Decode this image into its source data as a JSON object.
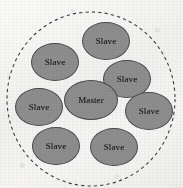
{
  "figure": {
    "type": "cluster-diagram",
    "background_color": "#f2f2f0",
    "boundary": {
      "shape": "circle",
      "style": "dashed",
      "stroke_color": "#3c3c3c",
      "center_x": 91,
      "center_y": 99,
      "radius": 84
    },
    "node_style": {
      "shape": "ellipse",
      "fill_color": "#8d8d8d",
      "stroke_color": "#4a4a4a",
      "text_color": "#1c1c1c"
    },
    "nodes": [
      {
        "id": "node-master",
        "label": "Master",
        "role": "master",
        "cx": 91,
        "cy": 100,
        "rx": 27,
        "ry": 20
      },
      {
        "id": "node-slave-1",
        "label": "Slave",
        "role": "slave",
        "cx": 106,
        "cy": 41,
        "rx": 24,
        "ry": 19
      },
      {
        "id": "node-slave-2",
        "label": "Slave",
        "role": "slave",
        "cx": 55,
        "cy": 62,
        "rx": 24,
        "ry": 19
      },
      {
        "id": "node-slave-3",
        "label": "Slave",
        "role": "slave",
        "cx": 127,
        "cy": 79,
        "rx": 24,
        "ry": 19
      },
      {
        "id": "node-slave-4",
        "label": "Slave",
        "role": "slave",
        "cx": 39,
        "cy": 107,
        "rx": 24,
        "ry": 19
      },
      {
        "id": "node-slave-5",
        "label": "Slave",
        "role": "slave",
        "cx": 149,
        "cy": 111,
        "rx": 24,
        "ry": 19
      },
      {
        "id": "node-slave-6",
        "label": "Slave",
        "role": "slave",
        "cx": 56,
        "cy": 146,
        "rx": 24,
        "ry": 19
      },
      {
        "id": "node-slave-7",
        "label": "Slave",
        "role": "slave",
        "cx": 114,
        "cy": 147,
        "rx": 24,
        "ry": 19
      }
    ]
  }
}
